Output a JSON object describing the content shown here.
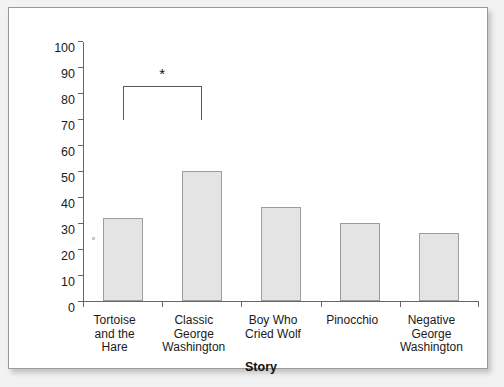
{
  "chart_data": {
    "type": "bar",
    "title": "",
    "xlabel": "Story",
    "ylabel": "Peekers Who Told the Truth (%)",
    "categories": [
      "Tortoise\nand the\nHare",
      "Classic\nGeorge\nWashington",
      "Boy Who\nCried Wolf",
      "Pinocchio",
      "Negative\nGeorge\nWashington"
    ],
    "values": [
      32,
      50,
      36,
      30,
      26
    ],
    "ylim": [
      0,
      100
    ],
    "yticks": [
      0,
      10,
      20,
      30,
      40,
      50,
      60,
      70,
      80,
      90,
      100
    ],
    "ytick_labels": [
      "0",
      "10",
      "20",
      "30",
      "40",
      "50",
      "60",
      "70",
      "80",
      "90",
      "100"
    ],
    "grid": false,
    "legend": null,
    "annotations": [
      {
        "type": "significance-bracket",
        "label": "*",
        "from_category": "Tortoise\nand the\nHare",
        "to_category": "Classic\nGeorge\nWashington",
        "bracket_top_value": 83,
        "bracket_leg_bottom_value": 70
      }
    ],
    "colors": {
      "bar_fill": "#e4e4e4",
      "bar_border": "#9d9d9d",
      "axis": "#666666",
      "text": "#1a1a1a",
      "card_background": "#ffffff",
      "card_border": "#9a9a9a",
      "page_background": "#f2f2f2"
    }
  }
}
